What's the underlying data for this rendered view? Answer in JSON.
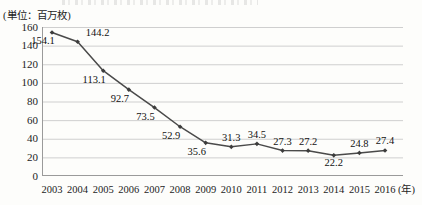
{
  "unit_label": "(単位：百万枚)",
  "x_axis_unit": "(年)",
  "chart_data": {
    "type": "line",
    "title": "",
    "subtitle": "",
    "xlabel": "(年)",
    "ylabel": "(単位：百万枚)",
    "xlim": [
      2003,
      2016
    ],
    "ylim": [
      0,
      160
    ],
    "ytick_step": 20,
    "grid": "horizontal",
    "legend": "none",
    "line_color": "#4a4a4a",
    "marker": "diamond",
    "categories": [
      "2003",
      "2004",
      "2005",
      "2006",
      "2007",
      "2008",
      "2009",
      "2010",
      "2011",
      "2012",
      "2013",
      "2014",
      "2015",
      "2016"
    ],
    "values": [
      154.1,
      144.2,
      113.1,
      92.7,
      73.5,
      52.9,
      35.6,
      31.3,
      34.5,
      27.3,
      27.2,
      22.2,
      24.8,
      27.4
    ],
    "yticks": [
      "0",
      "20",
      "40",
      "60",
      "80",
      "100",
      "120",
      "140",
      "160"
    ],
    "data_labels": [
      {
        "year": "2003",
        "value": "154.1",
        "position": "below-left"
      },
      {
        "year": "2004",
        "value": "144.2",
        "position": "above-right"
      },
      {
        "year": "2005",
        "value": "113.1",
        "position": "below-left"
      },
      {
        "year": "2006",
        "value": "92.7",
        "position": "below-left"
      },
      {
        "year": "2007",
        "value": "73.5",
        "position": "below-left"
      },
      {
        "year": "2008",
        "value": "52.9",
        "position": "below-left"
      },
      {
        "year": "2009",
        "value": "35.6",
        "position": "below-left"
      },
      {
        "year": "2010",
        "value": "31.3",
        "position": "above"
      },
      {
        "year": "2011",
        "value": "34.5",
        "position": "above"
      },
      {
        "year": "2012",
        "value": "27.3",
        "position": "above"
      },
      {
        "year": "2013",
        "value": "27.2",
        "position": "above"
      },
      {
        "year": "2014",
        "value": "22.2",
        "position": "below"
      },
      {
        "year": "2015",
        "value": "24.8",
        "position": "above"
      },
      {
        "year": "2016",
        "value": "27.4",
        "position": "above"
      }
    ]
  }
}
